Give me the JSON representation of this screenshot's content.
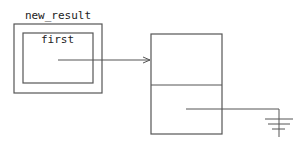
{
  "diagram": {
    "type": "pointer-diagram",
    "nodes": {
      "outer": {
        "label": "new_result"
      },
      "inner": {
        "label": "first"
      },
      "target": {
        "cells": 2
      }
    },
    "edges": [
      {
        "from": "first",
        "to": "target.cell0",
        "kind": "arrow"
      },
      {
        "from": "target.cell1",
        "to": "ground",
        "kind": "null-pointer"
      }
    ]
  }
}
